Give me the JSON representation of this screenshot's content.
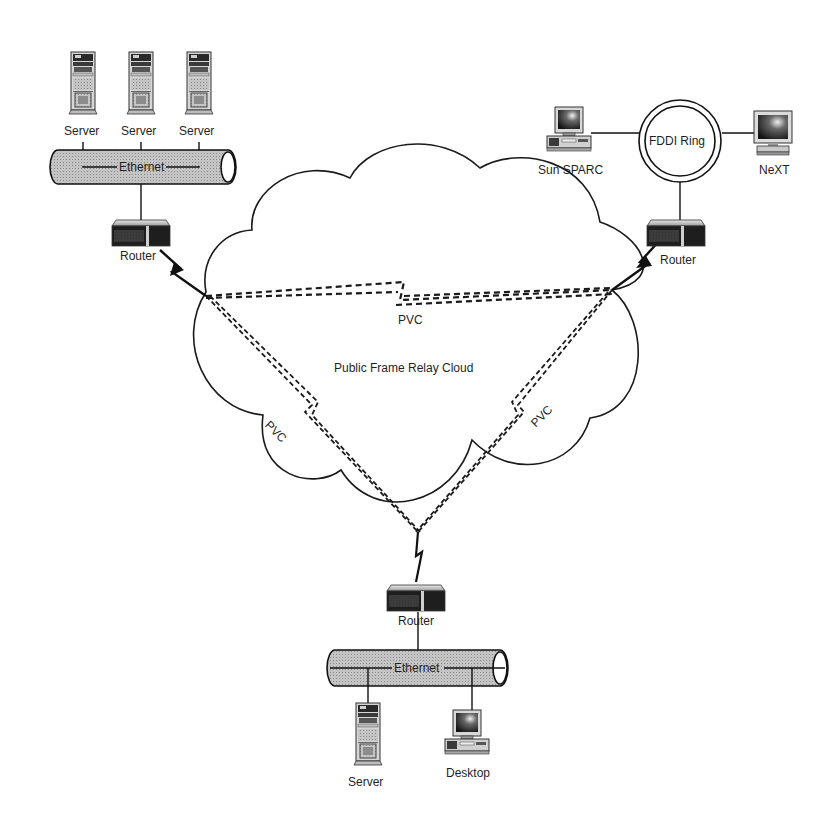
{
  "diagram": {
    "title": "Public Frame Relay Cloud",
    "cloud_label": "Public Frame Relay Cloud",
    "colors": {
      "line": "#1a1a1a",
      "ethernet_fill": "#b8b8b8",
      "router_dark": "#1c1c1c",
      "router_light": "#c8c8c8",
      "device_body": "#d9d9d9",
      "screen": "#2a2a2a",
      "background": "#ffffff"
    },
    "sites": {
      "top_left": {
        "servers": [
          {
            "label": "Server"
          },
          {
            "label": "Server"
          },
          {
            "label": "Server"
          }
        ],
        "network": {
          "label": "Ethernet"
        },
        "router": {
          "label": "Router"
        }
      },
      "top_right": {
        "workstations": [
          {
            "label": "Sun SPARC"
          },
          {
            "label": "NeXT"
          }
        ],
        "network": {
          "label": "FDDI Ring"
        },
        "router": {
          "label": "Router"
        }
      },
      "bottom": {
        "router": {
          "label": "Router"
        },
        "network": {
          "label": "Ethernet"
        },
        "devices": [
          {
            "label": "Server"
          },
          {
            "label": "Desktop"
          }
        ]
      }
    },
    "pvcs": [
      {
        "label": "PVC",
        "from": "top_left",
        "to": "top_right"
      },
      {
        "label": "PVC",
        "from": "top_left",
        "to": "bottom"
      },
      {
        "label": "PVC",
        "from": "top_right",
        "to": "bottom"
      }
    ]
  }
}
